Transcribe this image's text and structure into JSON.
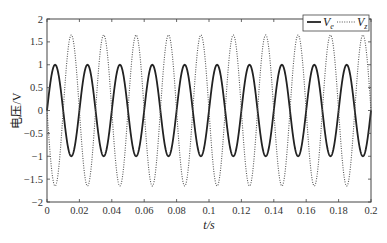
{
  "chart_data": {
    "type": "line",
    "title": "",
    "xlabel": "t/s",
    "ylabel": "电压/V",
    "xlim": [
      0,
      0.2
    ],
    "ylim": [
      -2,
      2
    ],
    "grid": false,
    "legend_position": "upper right",
    "xticks": [
      0,
      0.02,
      0.04,
      0.06,
      0.08,
      0.1,
      0.12,
      0.14,
      0.16,
      0.18,
      0.2
    ],
    "xtick_labels": [
      "0",
      "0.02",
      "0.04",
      "0.06",
      "0.08",
      "0.1",
      "0.12",
      "0.14",
      "0.16",
      "0.18",
      "0.2"
    ],
    "yticks": [
      -2,
      -1.5,
      -1,
      -0.5,
      0,
      0.5,
      1,
      1.5,
      2
    ],
    "ytick_labels": [
      "-2",
      "-1.5",
      "-1",
      "-0.5",
      "0",
      "0.5",
      "1",
      "1.5",
      "2"
    ],
    "series": [
      {
        "name": "V_e",
        "label_main": "V",
        "label_sub": "e",
        "style": "solid",
        "color": "#222222",
        "amplitude": 1.0,
        "frequency_hz": 50,
        "phase_rad": 0,
        "description": "1.0·sin(2π·50·t)"
      },
      {
        "name": "V_z",
        "label_main": "V",
        "label_sub": "z",
        "style": "dotted",
        "color": "#555555",
        "amplitude": 1.65,
        "frequency_hz": 50,
        "phase_rad": 3.14159,
        "description": "-1.65·sin(2π·50·t)"
      }
    ]
  }
}
